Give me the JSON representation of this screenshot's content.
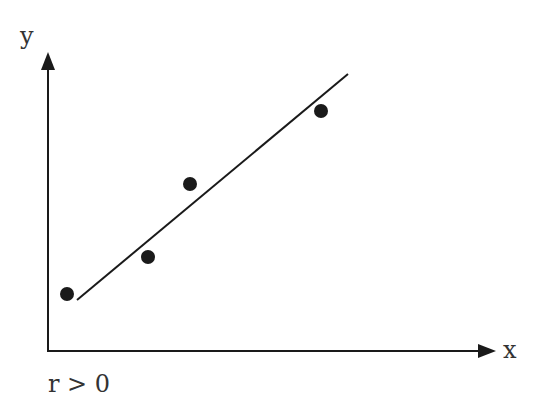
{
  "chart_data": {
    "type": "scatter",
    "title": "",
    "xlabel": "x",
    "ylabel": "y",
    "annotation": "r > 0",
    "grid": false,
    "points": [
      {
        "x": 67,
        "y": 294
      },
      {
        "x": 148,
        "y": 257
      },
      {
        "x": 190,
        "y": 184
      },
      {
        "x": 321,
        "y": 111
      }
    ],
    "trend_line": {
      "x1": 77,
      "y1": 300,
      "x2": 348,
      "y2": 74
    }
  },
  "labels": {
    "x_axis": "x",
    "y_axis": "y",
    "correlation": "r > 0"
  },
  "colors": {
    "ink": "#1a1a1a",
    "text": "#333333"
  }
}
